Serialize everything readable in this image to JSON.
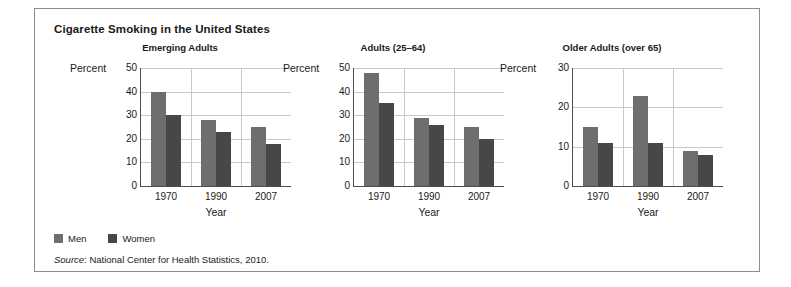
{
  "figure": {
    "title": "Cigarette Smoking in the United States",
    "source_word": "Source",
    "source_text": ": National Center for Health Statistics, 2010."
  },
  "legend": {
    "position": "bottom-left",
    "items": [
      {
        "label": "Men",
        "color": "#6e6e6e",
        "swatch_name": "legend-swatch-men"
      },
      {
        "label": "Women",
        "color": "#474747",
        "swatch_name": "legend-swatch-women"
      }
    ]
  },
  "chart_data": [
    {
      "type": "bar",
      "title": "Emerging Adults",
      "xlabel": "Year",
      "ylabel": "Percent",
      "categories": [
        "1970",
        "1990",
        "2007"
      ],
      "series": [
        {
          "name": "Men",
          "color": "#6e6e6e",
          "values": [
            40,
            28,
            25
          ]
        },
        {
          "name": "Women",
          "color": "#474747",
          "values": [
            30,
            23,
            18
          ]
        }
      ],
      "ylim": [
        0,
        50
      ],
      "yticks": [
        0,
        10,
        20,
        30,
        40,
        50
      ],
      "grid": true
    },
    {
      "type": "bar",
      "title": "Adults (25–64)",
      "xlabel": "Year",
      "ylabel": "Percent",
      "categories": [
        "1970",
        "1990",
        "2007"
      ],
      "series": [
        {
          "name": "Men",
          "color": "#6e6e6e",
          "values": [
            48,
            29,
            25
          ]
        },
        {
          "name": "Women",
          "color": "#474747",
          "values": [
            35,
            26,
            20
          ]
        }
      ],
      "ylim": [
        0,
        50
      ],
      "yticks": [
        0,
        10,
        20,
        30,
        40,
        50
      ],
      "grid": true
    },
    {
      "type": "bar",
      "title": "Older Adults (over 65)",
      "xlabel": "Year",
      "ylabel": "Percent",
      "categories": [
        "1970",
        "1990",
        "2007"
      ],
      "series": [
        {
          "name": "Men",
          "color": "#6e6e6e",
          "values": [
            15,
            23,
            9
          ]
        },
        {
          "name": "Women",
          "color": "#474747",
          "values": [
            11,
            11,
            8
          ]
        }
      ],
      "ylim": [
        0,
        30
      ],
      "yticks": [
        0,
        10,
        20,
        30
      ],
      "grid": true
    }
  ]
}
